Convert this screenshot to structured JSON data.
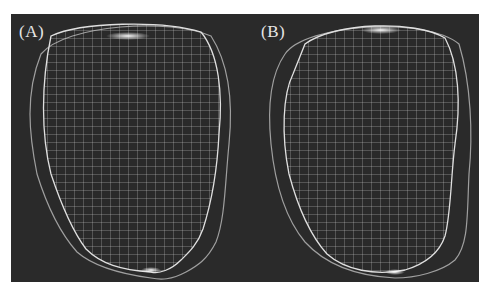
{
  "figure": {
    "background_color": "#2a2a2a",
    "line_color": "#d8d8d8",
    "panels": [
      {
        "label": "(A)",
        "description": "3D wireframe mesh surface with outer contour"
      },
      {
        "label": "(B)",
        "description": "3D wireframe mesh surface with outer contour"
      }
    ]
  }
}
